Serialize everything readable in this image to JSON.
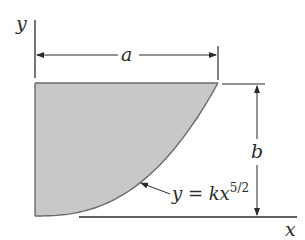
{
  "diagram": {
    "labels": {
      "y_axis": "y",
      "x_axis": "x",
      "width_dim": "a",
      "height_dim": "b",
      "curve_eq_base": "y = kx",
      "curve_eq_exp": "5/2"
    },
    "colors": {
      "fill": "#c8c8c8",
      "stroke": "#3a3a3a",
      "curve": "#6a6a6a"
    }
  }
}
